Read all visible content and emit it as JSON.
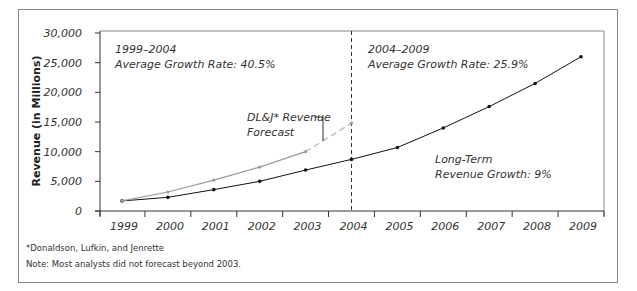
{
  "chart_data": {
    "type": "line",
    "title": "",
    "xlabel": "",
    "ylabel": "Revenue (in Millions)",
    "ylim": [
      0,
      30000
    ],
    "yticks": [
      0,
      5000,
      10000,
      15000,
      20000,
      25000,
      30000
    ],
    "ytick_labels": [
      "0",
      "5,000",
      "10,000",
      "15,000",
      "20,000",
      "25,000",
      "30,000"
    ],
    "categories": [
      "1999",
      "2000",
      "2001",
      "2002",
      "2003",
      "2004",
      "2005",
      "2006",
      "2007",
      "2008",
      "2009"
    ],
    "grid": false,
    "series": [
      {
        "name": "Actual / Projected Revenue",
        "color": "#111111",
        "style": "solid",
        "values": [
          1700,
          2300,
          3600,
          5000,
          6900,
          8700,
          10700,
          14000,
          17600,
          21500,
          26000
        ]
      },
      {
        "name": "DL&J* Revenue Forecast",
        "color": "#9a9a9a",
        "style": "solid-then-dashed",
        "dashed_from": "2003",
        "values": [
          1700,
          3200,
          5200,
          7400,
          10000,
          14800,
          null,
          null,
          null,
          null,
          null
        ]
      }
    ],
    "reference_line": {
      "x": "2004",
      "style": "dashed",
      "color": "#333333"
    },
    "annotations": [
      {
        "id": "left_period",
        "lines": [
          "1999–2004",
          "Average Growth Rate: 40.5%"
        ]
      },
      {
        "id": "right_period",
        "lines": [
          "2004–2009",
          "Average Growth Rate: 25.9%"
        ]
      },
      {
        "id": "forecast_label",
        "lines": [
          "DL&J* Revenue",
          "Forecast"
        ]
      },
      {
        "id": "long_term",
        "lines": [
          "Long-Term",
          "Revenue Growth: 9%"
        ]
      }
    ],
    "footnotes": [
      "*Donaldson, Lufkin, and Jenrette",
      "Note: Most analysts did not forecast beyond 2003."
    ]
  }
}
